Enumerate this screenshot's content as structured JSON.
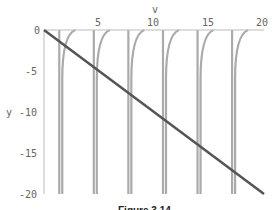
{
  "chart_data": {
    "type": "line",
    "title": "",
    "xlabel": "v",
    "ylabel": "y",
    "xlim": [
      0,
      20
    ],
    "ylim": [
      -20,
      0
    ],
    "x_ticks": [
      "5",
      "10",
      "15",
      "20"
    ],
    "y_ticks": [
      "0",
      "-5",
      "-10",
      "-15",
      "-20"
    ],
    "grid": false,
    "series": [
      {
        "name": "y = -v",
        "color": "#555555",
        "x": [
          0,
          20
        ],
        "y": [
          0,
          -20
        ]
      },
      {
        "name": "tan-like branches",
        "color": "#aaaaaa",
        "asymptotes": [
          1.57,
          4.71,
          7.85,
          11.0,
          14.14,
          17.28
        ]
      }
    ],
    "caption": "Figure 3.14"
  }
}
